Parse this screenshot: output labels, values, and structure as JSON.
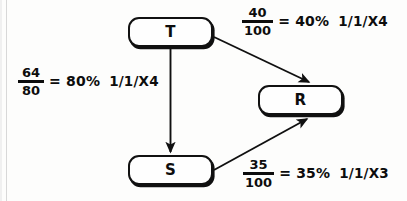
{
  "diagram": {
    "type": "node-link-diagram",
    "background_color": "#fdfdfc",
    "ink_color": "#0d0d0d",
    "nodes": [
      {
        "id": "T",
        "label": "T",
        "x": 128,
        "y": 17,
        "width": 85,
        "height": 30
      },
      {
        "id": "R",
        "label": "R",
        "x": 258,
        "y": 85,
        "width": 85,
        "height": 30
      },
      {
        "id": "S",
        "label": "S",
        "x": 128,
        "y": 155,
        "width": 85,
        "height": 30
      }
    ],
    "edges": [
      {
        "id": "t-to-r",
        "from": "T",
        "to": "R",
        "direction": "diagonal-down-right",
        "label": {
          "numerator": "40",
          "denominator": "100",
          "equals": "= 40%",
          "code": "1/1/X4"
        }
      },
      {
        "id": "t-to-s",
        "from": "T",
        "to": "S",
        "direction": "vertical-down",
        "label": {
          "numerator": "64",
          "denominator": "80",
          "equals": "= 80%",
          "code": "1/1/X4"
        }
      },
      {
        "id": "s-to-r",
        "from": "S",
        "to": "R",
        "direction": "diagonal-up-right",
        "label": {
          "numerator": "35",
          "denominator": "100",
          "equals": "= 35%",
          "code": "1/1/X3"
        }
      }
    ]
  }
}
